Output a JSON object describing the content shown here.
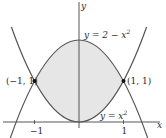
{
  "diagram": {
    "type": "region-between-curves",
    "curves": [
      {
        "id": "upper",
        "equation_label": "y = 2 − x²",
        "label_prefix": "y = 2 − x",
        "label_sup": "2"
      },
      {
        "id": "lower",
        "equation_label": "y = x²",
        "label_prefix": "y = x",
        "label_sup": "2"
      }
    ],
    "intersection_points": [
      {
        "label": "(−1, 1)",
        "x": -1,
        "y": 1
      },
      {
        "label": "(1, 1)",
        "x": 1,
        "y": 1
      }
    ],
    "axes": {
      "x_label": "x",
      "y_label": "y",
      "x_ticks": [
        {
          "value": -1,
          "label": "−1"
        },
        {
          "value": 1,
          "label": "1"
        }
      ]
    },
    "shaded_region": "between y = x² and y = 2 − x² for −1 ≤ x ≤ 1",
    "colors": {
      "curve": "#555555",
      "axis": "#444444",
      "shade": "#e6e6e6",
      "point": "#111111"
    }
  }
}
